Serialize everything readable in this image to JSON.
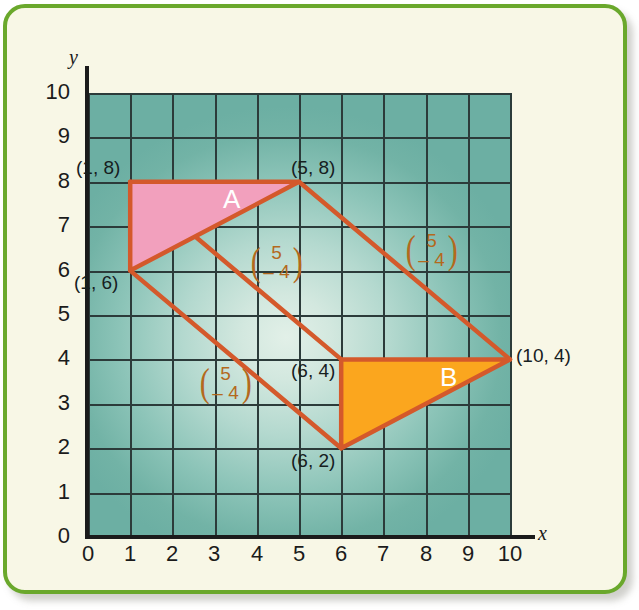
{
  "figure": {
    "type": "coordinate-grid-translation",
    "frame_color": "#6aa82c",
    "page_background": "#f8f7e6",
    "grid_color": "#2c3b3a",
    "axis_color": "#1b1b1b"
  },
  "axes": {
    "x_label": "x",
    "y_label": "y",
    "x_ticks": [
      "0",
      "1",
      "2",
      "3",
      "4",
      "5",
      "6",
      "7",
      "8",
      "9",
      "10"
    ],
    "y_ticks": [
      "0",
      "1",
      "2",
      "3",
      "4",
      "5",
      "6",
      "7",
      "8",
      "9",
      "10"
    ],
    "x_range": [
      0,
      10
    ],
    "y_range": [
      0,
      10
    ]
  },
  "shapes": [
    {
      "name": "A",
      "letter": "A",
      "fill": "#f2a0bd",
      "stroke": "#e0592c",
      "vertices": [
        [
          1,
          8
        ],
        [
          5,
          8
        ],
        [
          1,
          6
        ]
      ],
      "vertex_labels": [
        {
          "text": "(1, 8)",
          "point": [
            1,
            8
          ]
        },
        {
          "text": "(5, 8)",
          "point": [
            5,
            8
          ]
        },
        {
          "text": "(1, 6)",
          "point": [
            1,
            6
          ]
        }
      ]
    },
    {
      "name": "B",
      "letter": "B",
      "fill": "#fba61e",
      "stroke": "#e0592c",
      "vertices": [
        [
          6,
          4
        ],
        [
          10,
          4
        ],
        [
          6,
          2
        ]
      ],
      "vertex_labels": [
        {
          "text": "(6, 4)",
          "point": [
            6,
            4
          ]
        },
        {
          "text": "(10, 4)",
          "point": [
            10,
            4
          ]
        },
        {
          "text": "(6, 2)",
          "point": [
            6,
            2
          ]
        }
      ]
    }
  ],
  "translation_vectors": [
    {
      "top": "5",
      "bottom": "– 4",
      "from": [
        1,
        8
      ],
      "to": [
        6,
        4
      ],
      "color": "#b4691d"
    },
    {
      "top": "5",
      "bottom": "– 4",
      "from": [
        5,
        8
      ],
      "to": [
        10,
        4
      ],
      "color": "#b4691d"
    },
    {
      "top": "5",
      "bottom": "– 4",
      "from": [
        1,
        6
      ],
      "to": [
        6,
        2
      ],
      "color": "#b4691d"
    }
  ],
  "chart_data": {
    "type": "scatter",
    "title": "",
    "xlabel": "x",
    "ylabel": "y",
    "xlim": [
      0,
      10
    ],
    "ylim": [
      0,
      10
    ],
    "grid": true,
    "legend": "none",
    "series": [
      {
        "name": "Triangle A",
        "values": [
          [
            1,
            8
          ],
          [
            5,
            8
          ],
          [
            1,
            6
          ]
        ],
        "fill": "#f2a0bd",
        "stroke": "#e0592c"
      },
      {
        "name": "Triangle B",
        "values": [
          [
            6,
            4
          ],
          [
            10,
            4
          ],
          [
            6,
            2
          ]
        ],
        "fill": "#fba61e",
        "stroke": "#e0592c"
      }
    ],
    "annotations": [
      {
        "text": "(1, 8)",
        "x": 1,
        "y": 8
      },
      {
        "text": "(5, 8)",
        "x": 5,
        "y": 8
      },
      {
        "text": "(1, 6)",
        "x": 1,
        "y": 6
      },
      {
        "text": "(6, 4)",
        "x": 6,
        "y": 4
      },
      {
        "text": "(10, 4)",
        "x": 10,
        "y": 4
      },
      {
        "text": "(6, 2)",
        "x": 6,
        "y": 2
      },
      {
        "text": "A",
        "x": 3.4,
        "y": 7.6
      },
      {
        "text": "B",
        "x": 8.5,
        "y": 3.6
      },
      {
        "text": "(5, -4)",
        "x": 3.8,
        "y": 5.6
      },
      {
        "text": "(5, -4)",
        "x": 7.5,
        "y": 6.2
      },
      {
        "text": "(5, -4)",
        "x": 2.9,
        "y": 3.4
      }
    ]
  },
  "labels": {
    "a1": "(1, 8)",
    "a2": "(5, 8)",
    "a3": "(1, 6)",
    "b1": "(6, 4)",
    "b2": "(10, 4)",
    "b3": "(6, 2)",
    "letter_a": "A",
    "letter_b": "B",
    "vec_top": "5",
    "vec_bottom": "– 4",
    "paren_open": "(",
    "paren_close": ")"
  }
}
